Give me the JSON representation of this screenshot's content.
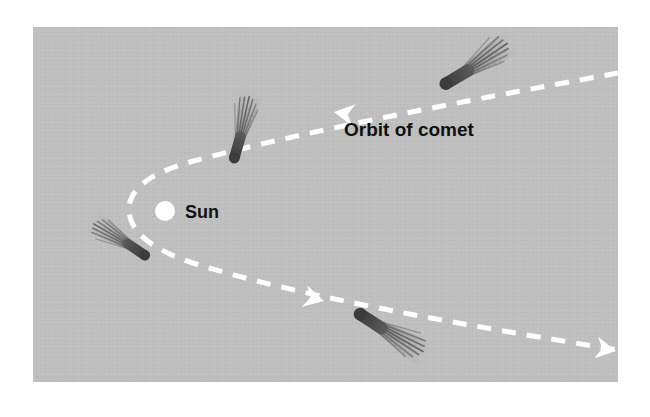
{
  "figure": {
    "canvas": {
      "width": 650,
      "height": 417
    },
    "background_color": "#ffffff"
  },
  "panel": {
    "name": "diagram-panel",
    "x": 33,
    "y": 27,
    "width": 585,
    "height": 355,
    "fill_color": "#bfbfbf",
    "texture": "halftone-dither"
  },
  "labels": {
    "orbit": {
      "text": "Orbit of comet",
      "x": 344,
      "y": 136,
      "color": "#111111"
    },
    "sun": {
      "text": "Sun",
      "x": 185,
      "y": 218,
      "color": "#111111"
    }
  },
  "sun": {
    "name": "sun-marker",
    "cx": 165,
    "cy": 211,
    "r": 10,
    "color": "#ffffff"
  },
  "orbit": {
    "name": "comet-orbit-path",
    "color": "#ffffff",
    "stroke_width": 5,
    "dash_pattern": "14 11",
    "shape": "parabola",
    "perihelion": {
      "x": 130,
      "y": 211
    },
    "upper_branch_end": {
      "x": 618,
      "y": 73
    },
    "lower_branch_end": {
      "x": 618,
      "y": 350
    }
  },
  "arrowheads": [
    {
      "name": "arrowhead-inbound-far",
      "x": 612,
      "y": 73,
      "direction": "left"
    },
    {
      "name": "arrowhead-inbound-near",
      "x": 332,
      "y": 111,
      "direction": "left"
    },
    {
      "name": "arrowhead-outbound-near",
      "x": 322,
      "y": 300,
      "direction": "right"
    },
    {
      "name": "arrowhead-outbound-far",
      "x": 612,
      "y": 350,
      "direction": "right"
    }
  ],
  "comets": [
    {
      "name": "comet-inbound-far",
      "position": {
        "x": 452,
        "y": 78
      },
      "head_angle_deg": -32,
      "tail_angle_deg": -32,
      "body_color": "#4a4a4a",
      "tail_color": "#6e6e6e",
      "description": "inbound comet upper right, tail points away from Sun to upper right"
    },
    {
      "name": "comet-inbound-near",
      "position": {
        "x": 234,
        "y": 148
      },
      "head_angle_deg": -72,
      "tail_angle_deg": -72,
      "body_color": "#4a4a4a",
      "tail_color": "#6e6e6e",
      "description": "inbound comet near perihelion, tail points up and slightly right"
    },
    {
      "name": "comet-outbound-near",
      "position": {
        "x": 137,
        "y": 255
      },
      "head_angle_deg": 215,
      "tail_angle_deg": 215,
      "body_color": "#4a4a4a",
      "tail_color": "#6e6e6e",
      "description": "outbound comet lower left of Sun, tail points down-left"
    },
    {
      "name": "comet-outbound-far",
      "position": {
        "x": 366,
        "y": 318
      },
      "head_angle_deg": 33,
      "tail_angle_deg": 33,
      "body_color": "#4a4a4a",
      "tail_color": "#6e6e6e",
      "description": "outbound comet lower right, tail points down-right"
    }
  ]
}
